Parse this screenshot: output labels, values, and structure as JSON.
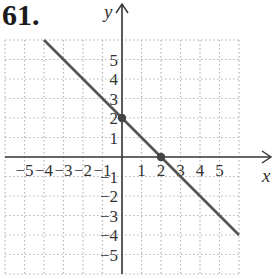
{
  "problem_number": "61.",
  "chart_data": {
    "type": "line",
    "title": "",
    "xlabel": "x",
    "ylabel": "y",
    "xlim": [
      -6,
      6
    ],
    "ylim": [
      -6,
      6
    ],
    "grid": true,
    "grid_style": "dotted",
    "x_ticks": [
      "-5",
      "-4",
      "-3",
      "-2",
      "-1",
      "1",
      "2",
      "3",
      "4",
      "5"
    ],
    "y_ticks": [
      "5",
      "4",
      "3",
      "2",
      "1",
      "-1",
      "-2",
      "-3",
      "-4",
      "-5"
    ],
    "series": [
      {
        "name": "y = -x + 2",
        "x": [
          -4,
          6
        ],
        "y": [
          6,
          -4
        ],
        "color": "#555555"
      }
    ],
    "points": [
      {
        "label": "y-intercept",
        "x": 0,
        "y": 2
      },
      {
        "label": "x-intercept",
        "x": 2,
        "y": 0
      }
    ]
  },
  "colors": {
    "grid": "#b5b5b5",
    "axis": "#333333",
    "line": "#555555",
    "point": "#444444"
  }
}
